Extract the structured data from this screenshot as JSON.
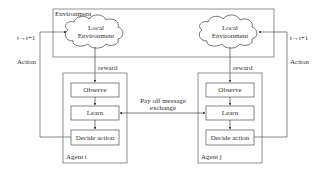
{
  "environment": {
    "label": "Environment",
    "left_cloud": {
      "line1": "Local",
      "line2": "Environment"
    },
    "right_cloud": {
      "line1": "Local",
      "line2": "Environment"
    }
  },
  "left_side": {
    "time_step": "t→t+1",
    "action": "Action",
    "reward": "reward"
  },
  "right_side": {
    "time_step": "t→t+1",
    "action": "Action",
    "reward": "reward"
  },
  "agent_i": {
    "label": "Agent i",
    "steps": [
      "Observe",
      "Learn",
      "Decide action"
    ]
  },
  "agent_j": {
    "label": "Agent j",
    "steps": [
      "Observe",
      "Learn",
      "Decide action"
    ]
  },
  "exchange": {
    "line1": "Pay off message",
    "line2": "exchange"
  },
  "colors": {
    "line": "#555555",
    "box_border": "#666666",
    "background": "#ffffff"
  }
}
